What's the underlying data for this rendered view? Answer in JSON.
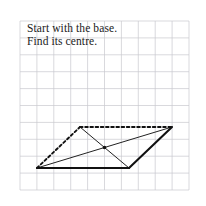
{
  "page": {
    "title": "Start with the base. Find its centre.",
    "background_color": "#ffffff",
    "width": 206,
    "height": 206
  },
  "caption": {
    "line1": "Start with the base.",
    "line2": "Find its centre.",
    "text_color": "#1a1a1a"
  },
  "grid": {
    "color": "#c9c9cf",
    "stroke_width": 0.7,
    "cell_size": 16.9,
    "x_start": 20,
    "x_end": 190,
    "y_start": 21,
    "y_end": 190,
    "vertical_line_x": [
      20,
      36.9,
      53.8,
      70.7,
      87.6,
      104.5,
      121.4,
      138.3,
      155.2,
      172.1,
      189.0
    ],
    "horizontal_line_y": [
      21,
      37.9,
      54.8,
      71.7,
      88.6,
      105.5,
      122.4,
      139.3,
      156.2,
      173.1,
      190.0
    ]
  },
  "figure": {
    "name": "parallelogram-with-diagonals",
    "stroke_color": "#111111",
    "vertices": {
      "bottom_left": {
        "label": "A",
        "x": 37,
        "y": 168
      },
      "top_left": {
        "label": "B",
        "x": 80,
        "y": 127
      },
      "top_right": {
        "label": "C",
        "x": 172,
        "y": 127
      },
      "bottom_right": {
        "label": "D",
        "x": 129,
        "y": 168
      }
    },
    "centre_point": {
      "label": "centre",
      "x": 104.5,
      "y": 147.5,
      "radius": 1.8
    },
    "edges": [
      {
        "name": "base-edge",
        "from": "bottom_left",
        "to": "bottom_right",
        "style": "solid",
        "width": 2.1
      },
      {
        "name": "right-edge",
        "from": "bottom_right",
        "to": "top_right",
        "style": "solid",
        "width": 2.1
      },
      {
        "name": "left-edge",
        "from": "bottom_left",
        "to": "top_left",
        "style": "dashed",
        "width": 1.9,
        "dash_pattern": "2.6 2.6"
      },
      {
        "name": "top-edge",
        "from": "top_left",
        "to": "top_right",
        "style": "dashed",
        "width": 1.9,
        "dash_pattern": "2.6 2.6"
      },
      {
        "name": "diagonal-a-c",
        "from": "bottom_left",
        "to": "top_right",
        "style": "solid",
        "width": 1.0
      },
      {
        "name": "diagonal-b-d",
        "from": "top_left",
        "to": "bottom_right",
        "style": "solid",
        "width": 1.0
      }
    ]
  }
}
